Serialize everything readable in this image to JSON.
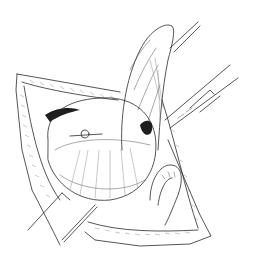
{
  "illustration": {
    "subject": "surgical line drawing",
    "style": "pen-and-ink medical illustration",
    "background_color": "#ffffff",
    "line_color": "#2a2a2a",
    "elements": [
      {
        "name": "abdominal-wall-incision",
        "description": "retracted incision edges framing the field"
      },
      {
        "name": "elevated-organ",
        "description": "elongated organ lifted upward, held by forceps at top right"
      },
      {
        "name": "rounded-organ",
        "description": "large rounded organ in center of field"
      },
      {
        "name": "bowel-loop",
        "description": "curved loop at lower right"
      },
      {
        "name": "forceps-top",
        "description": "instrument grasping organ tip"
      },
      {
        "name": "clamp-right",
        "description": "long clamp entering from right"
      },
      {
        "name": "retractor-lower-left",
        "description": "blade retractor at lower left"
      },
      {
        "name": "probe-lower",
        "description": "thin instrument at bottom center"
      }
    ]
  }
}
